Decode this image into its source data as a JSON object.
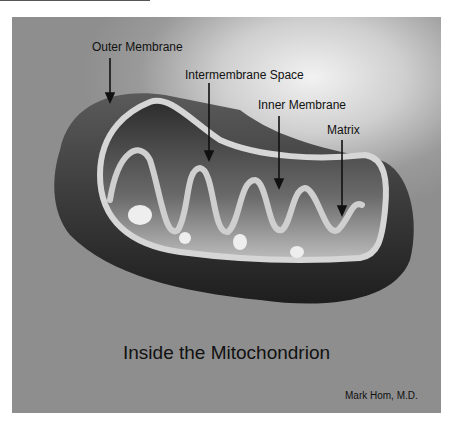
{
  "diagram": {
    "title": "Inside the Mitochondrion",
    "credit": "Mark Hom, M.D.",
    "labels": [
      {
        "text": "Outer Membrane",
        "x": 92,
        "y": 40
      },
      {
        "text": "Intermembrane  Space",
        "x": 185,
        "y": 68
      },
      {
        "text": "Inner Membrane",
        "x": 258,
        "y": 98
      },
      {
        "text": "Matrix",
        "x": 327,
        "y": 123
      }
    ],
    "colors": {
      "background": "#8e8e8e",
      "outer_membrane": "#2a2a2a",
      "inner_membrane": "#d8d8d8",
      "text": "#111111"
    }
  }
}
